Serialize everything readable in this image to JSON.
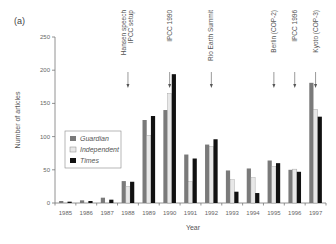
{
  "chart_data": {
    "type": "bar",
    "panel_label": "(a)",
    "title": "",
    "xlabel": "Year",
    "ylabel": "Number of articles",
    "ylim": [
      0,
      250
    ],
    "yticks": [
      0,
      50,
      100,
      150,
      200,
      250
    ],
    "categories": [
      "1985",
      "1986",
      "1987",
      "1988",
      "1989",
      "1990",
      "1991",
      "1992",
      "1993",
      "1994",
      "1995",
      "1996",
      "1997"
    ],
    "series": [
      {
        "name": "Guardian",
        "color": "#7a7a7a",
        "values": [
          3,
          4,
          8,
          33,
          125,
          140,
          73,
          88,
          49,
          52,
          64,
          50,
          181
        ]
      },
      {
        "name": "Independent",
        "color": "#e8e8e8",
        "values": [
          0,
          0,
          0,
          25,
          102,
          165,
          32,
          85,
          35,
          38,
          55,
          51,
          141
        ]
      },
      {
        "name": "Times",
        "color": "#111111",
        "values": [
          2,
          3,
          5,
          32,
          131,
          194,
          67,
          96,
          17,
          15,
          60,
          47,
          130
        ]
      }
    ],
    "legend": {
      "position": "left",
      "entries": [
        "Guardian",
        "Independent",
        "Times"
      ]
    },
    "grid": false,
    "annotations": [
      {
        "category": "1988",
        "lines": [
          "Hansen speech",
          "IPCC setup"
        ]
      },
      {
        "category": "1990",
        "lines": [
          "IPCC 1990"
        ]
      },
      {
        "category": "1992",
        "lines": [
          "Rio Earth Summit"
        ]
      },
      {
        "category": "1995",
        "lines": [
          "Berlin (COP-2)"
        ]
      },
      {
        "category": "1996",
        "lines": [
          "IPCC 1996"
        ]
      },
      {
        "category": "1997",
        "lines": [
          "Kyoto (COP-3)"
        ]
      }
    ]
  }
}
